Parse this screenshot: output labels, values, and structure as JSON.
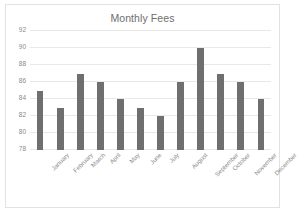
{
  "chart": {
    "title": "Monthly Fees",
    "bar_color": "#6f6f6f",
    "gridline_color": "#e8e8e8",
    "axis_text_color": "#8a8a8a",
    "title_color": "#6e6e6e",
    "border_color": "#e2e2e2"
  },
  "chart_data": {
    "type": "bar",
    "title": "Monthly Fees",
    "xlabel": "",
    "ylabel": "",
    "ylim": [
      78,
      92
    ],
    "ytick_step": 2,
    "yticks": [
      78,
      80,
      82,
      84,
      86,
      88,
      90,
      92
    ],
    "grid": true,
    "legend": false,
    "categories": [
      "January",
      "February",
      "March",
      "April",
      "May",
      "June",
      "July",
      "August",
      "September",
      "October",
      "November",
      "December"
    ],
    "values": [
      85,
      83,
      87,
      86,
      84,
      83,
      82,
      86,
      90,
      87,
      86,
      84
    ]
  }
}
